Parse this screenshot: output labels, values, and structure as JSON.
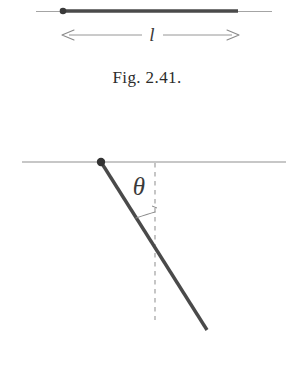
{
  "page": {
    "background_color": "#ffffff",
    "ink_color": "#3f3f3f",
    "rod_color": "#4a4a4a",
    "thin_line_color": "#8a8a8a",
    "dashed_line_color": "#9a9a9a"
  },
  "figures": [
    {
      "id": "fig-2-41",
      "caption": "Fig. 2.41.",
      "description": "Horizontal rod of length l pivoted at its left end",
      "elements": {
        "reference_line_label": "horizontal-reference-line",
        "rod_label": "rod",
        "pivot_label": "pivot-point",
        "dimension_label": "l",
        "dimension_description": "length-dimension-arrow"
      }
    },
    {
      "id": "fig-2-42",
      "caption": "Fig. 2.42.",
      "description": "Rod hanging at angle theta from the vertical dashed reference",
      "elements": {
        "reference_line_label": "horizontal-reference-line",
        "rod_label": "rod",
        "pivot_label": "pivot-point",
        "vertical_label": "vertical-dashed-line",
        "angle_label": "θ",
        "angle_description": "angle-arc"
      }
    }
  ]
}
